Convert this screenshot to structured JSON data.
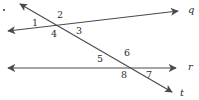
{
  "figure": {
    "width": 199,
    "height": 100,
    "background": "#ffffff",
    "stroke_color": "#4a4a4a",
    "text_color": "#2b2b2b"
  },
  "lines": [
    {
      "id": "line-q",
      "label": "q",
      "label_x": 188,
      "label_y": 5,
      "x1": 8,
      "y1": 31,
      "x2": 178,
      "y2": 11,
      "arrow_start": true,
      "arrow_end": true
    },
    {
      "id": "line-r",
      "label": "r",
      "label_x": 188,
      "label_y": 62,
      "x1": 8,
      "y1": 68,
      "x2": 176,
      "y2": 68,
      "arrow_start": true,
      "arrow_end": true
    },
    {
      "id": "line-t",
      "label": "t",
      "label_x": 180,
      "label_y": 88,
      "x1": 20,
      "y1": 4,
      "x2": 172,
      "y2": 92,
      "arrow_start": true,
      "arrow_end": true
    }
  ],
  "angle_labels": [
    {
      "id": "angle-1",
      "text": "1",
      "x": 32,
      "y": 18
    },
    {
      "id": "angle-2",
      "text": "2",
      "x": 57,
      "y": 10
    },
    {
      "id": "angle-3",
      "text": "3",
      "x": 76,
      "y": 26
    },
    {
      "id": "angle-4",
      "text": "4",
      "x": 51,
      "y": 29
    },
    {
      "id": "angle-5",
      "text": "5",
      "x": 97,
      "y": 54
    },
    {
      "id": "angle-6",
      "text": "6",
      "x": 124,
      "y": 48
    },
    {
      "id": "angle-7",
      "text": "7",
      "x": 146,
      "y": 70
    },
    {
      "id": "angle-8",
      "text": "8",
      "x": 121,
      "y": 70
    }
  ],
  "marks": [
    {
      "id": "corner-dot",
      "x": 3,
      "y": 9
    }
  ]
}
